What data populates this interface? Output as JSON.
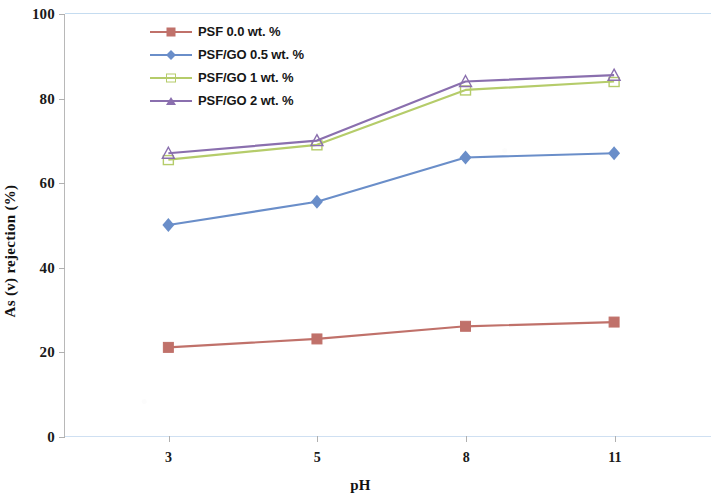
{
  "chart_data": {
    "type": "line",
    "title": "",
    "xlabel": "pH",
    "ylabel": "As (v) rejection (%)",
    "categories": [
      "3",
      "5",
      "8",
      "11"
    ],
    "ylim": [
      0,
      100
    ],
    "yticks": [
      "0",
      "20",
      "40",
      "60",
      "80",
      "100"
    ],
    "grid": "horizontal-top-bottom-only",
    "legend_position": "top-center-inside",
    "series": [
      {
        "name": "PSF 0.0 wt. %",
        "color": "#c0716a",
        "marker": "square",
        "values": [
          21,
          23,
          26,
          27
        ]
      },
      {
        "name": "PSF/GO 0.5 wt. %",
        "color": "#6a8ec9",
        "marker": "diamond",
        "values": [
          50,
          55.5,
          66,
          67
        ]
      },
      {
        "name": "PSF/GO 1 wt. %",
        "color": "#b5cc6a",
        "marker": "square-open",
        "values": [
          65.5,
          69,
          82,
          84
        ]
      },
      {
        "name": "PSF/GO 2 wt. %",
        "color": "#8a6fae",
        "marker": "triangle-open",
        "values": [
          67,
          70,
          84,
          85.5
        ]
      }
    ]
  },
  "axis": {
    "y_title": "As (v) rejection (%)",
    "x_title": "pH"
  },
  "colors": {
    "plot_background": "#ffffff",
    "axis_line": "#b8b8b8",
    "gridline": "#c5dcf0",
    "text": "#121212"
  }
}
